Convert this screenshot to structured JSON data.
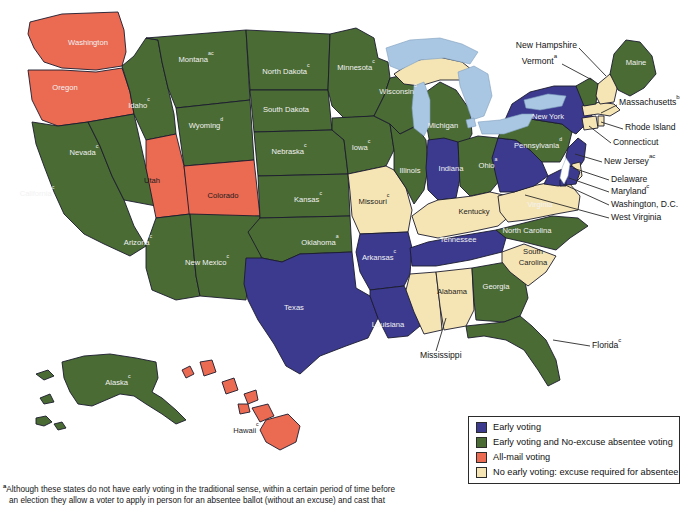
{
  "figure": {
    "type": "choropleth-map"
  },
  "colors": {
    "early_voting": "#3b3a8f",
    "early_and_no_excuse_absentee": "#4a6b34",
    "all_mail": "#ea6a52",
    "no_early_voting": "#f6e5b4",
    "lake": "#a9c6e2",
    "border": "#1b1b2e",
    "background": "#ffffff"
  },
  "legend": {
    "items": [
      {
        "color_key": "early_voting",
        "label": "Early voting"
      },
      {
        "color_key": "early_and_no_excuse_absentee",
        "label": "Early voting and No-excuse absentee voting"
      },
      {
        "color_key": "all_mail",
        "label": "All-mail voting"
      },
      {
        "color_key": "no_early_voting",
        "label": "No early voting: excuse required for absentee"
      }
    ]
  },
  "footnote": {
    "marker": "a",
    "line1": "Although these states do not have early voting in the traditional sense, within a certain period of time before",
    "line2": "an election they allow a voter to apply in person for an absentee ballot (without an excuse) and cast that"
  },
  "inline_labels": [
    {
      "name": "washington",
      "text": "Washington",
      "sup": "",
      "x": 88,
      "y": 43,
      "dark": true
    },
    {
      "name": "oregon",
      "text": "Oregon",
      "sup": "",
      "x": 65,
      "y": 88,
      "dark": true
    },
    {
      "name": "idaho",
      "text": "Idaho",
      "sup": "c",
      "x": 139,
      "y": 106,
      "dark": true
    },
    {
      "name": "montana",
      "text": "Montana",
      "sup": "ac",
      "x": 196,
      "y": 60,
      "dark": true
    },
    {
      "name": "wyoming",
      "text": "Wyoming",
      "sup": "d",
      "x": 206,
      "y": 126,
      "dark": true
    },
    {
      "name": "nevada",
      "text": "Nevada",
      "sup": "c",
      "x": 84,
      "y": 153,
      "dark": true
    },
    {
      "name": "utah",
      "text": "Utah",
      "sup": "",
      "x": 152,
      "y": 181,
      "dark": false
    },
    {
      "name": "colorado",
      "text": "Colorado",
      "sup": "",
      "x": 223,
      "y": 196,
      "dark": false
    },
    {
      "name": "california",
      "text": "California",
      "sup": "c",
      "x": 37,
      "y": 194,
      "dark": true
    },
    {
      "name": "arizona",
      "text": "Arizona",
      "sup": "c",
      "x": 138,
      "y": 243,
      "dark": true
    },
    {
      "name": "new-mexico",
      "text": "New Mexico",
      "sup": "c",
      "x": 207,
      "y": 263,
      "dark": true
    },
    {
      "name": "north-dakota",
      "text": "North Dakota",
      "sup": "c",
      "x": 286,
      "y": 72,
      "dark": true
    },
    {
      "name": "south-dakota",
      "text": "South Dakota",
      "sup": "",
      "x": 286,
      "y": 110,
      "dark": true
    },
    {
      "name": "nebraska",
      "text": "Nebraska",
      "sup": "c",
      "x": 289,
      "y": 152,
      "dark": true
    },
    {
      "name": "kansas",
      "text": "Kansas",
      "sup": "c",
      "x": 308,
      "y": 200,
      "dark": true
    },
    {
      "name": "oklahoma",
      "text": "Oklahoma",
      "sup": "a",
      "x": 320,
      "y": 243,
      "dark": true
    },
    {
      "name": "texas",
      "text": "Texas",
      "sup": "",
      "x": 294,
      "y": 308,
      "dark": true
    },
    {
      "name": "minnesota",
      "text": "Minnesota",
      "sup": "c",
      "x": 356,
      "y": 68,
      "dark": true
    },
    {
      "name": "iowa",
      "text": "Iowa",
      "sup": "c",
      "x": 361,
      "y": 148,
      "dark": true
    },
    {
      "name": "missouri",
      "text": "Missouri",
      "sup": "c",
      "x": 374,
      "y": 202,
      "dark": false
    },
    {
      "name": "arkansas",
      "text": "Arkansas",
      "sup": "c",
      "x": 379,
      "y": 258,
      "dark": true
    },
    {
      "name": "louisiana",
      "text": "Louisiana",
      "sup": "",
      "x": 388,
      "y": 325,
      "dark": true
    },
    {
      "name": "wisconsin",
      "text": "Wisconsin",
      "sup": "d",
      "x": 398,
      "y": 92,
      "dark": true
    },
    {
      "name": "illinois",
      "text": "Illinois",
      "sup": "",
      "x": 410,
      "y": 171,
      "dark": true
    },
    {
      "name": "michigan",
      "text": "Michigan",
      "sup": "",
      "x": 443,
      "y": 126,
      "dark": true
    },
    {
      "name": "indiana",
      "text": "Indiana",
      "sup": "",
      "x": 451,
      "y": 169,
      "dark": true
    },
    {
      "name": "ohio",
      "text": "Ohio",
      "sup": "a",
      "x": 488,
      "y": 166,
      "dark": true
    },
    {
      "name": "kentucky",
      "text": "Kentucky",
      "sup": "",
      "x": 474,
      "y": 212,
      "dark": false
    },
    {
      "name": "tennessee",
      "text": "Tennessee",
      "sup": "",
      "x": 458,
      "y": 240,
      "dark": true
    },
    {
      "name": "alabama",
      "text": "Alabama",
      "sup": "",
      "x": 452,
      "y": 292,
      "dark": false
    },
    {
      "name": "georgia",
      "text": "Georgia",
      "sup": "",
      "x": 496,
      "y": 287,
      "dark": true
    },
    {
      "name": "south-carolina",
      "text": "South",
      "sup": "",
      "x": 533,
      "y": 252,
      "dark": false
    },
    {
      "name": "south-carolina-2",
      "text": "Carolina",
      "sup": "",
      "x": 533,
      "y": 263,
      "dark": false
    },
    {
      "name": "north-carolina",
      "text": "North Carolina",
      "sup": "",
      "x": 527,
      "y": 231,
      "dark": true
    },
    {
      "name": "virginia",
      "text": "Virginia",
      "sup": "",
      "x": 540,
      "y": 205,
      "dark": true
    },
    {
      "name": "pennsylvania",
      "text": "Pennsylvania",
      "sup": "d",
      "x": 538,
      "y": 146,
      "dark": true
    },
    {
      "name": "new-york",
      "text": "New York",
      "sup": "",
      "x": 548,
      "y": 117,
      "dark": true
    },
    {
      "name": "maine",
      "text": "Maine",
      "sup": "",
      "x": 636,
      "y": 63,
      "dark": true
    },
    {
      "name": "alaska",
      "text": "Alaska",
      "sup": "c",
      "x": 118,
      "y": 383,
      "dark": true
    },
    {
      "name": "hawaii",
      "text": "Hawaii",
      "sup": "c",
      "x": 246,
      "y": 431,
      "dark": false
    }
  ],
  "callouts": [
    {
      "name": "new-hampshire",
      "text": "New Hampshire",
      "sup": "",
      "tx": 577,
      "ty": 46,
      "align": "end",
      "lx1": 579,
      "ly1": 48,
      "lx2": 606,
      "ly2": 76
    },
    {
      "name": "vermont",
      "text": "Vermont",
      "sup": "a",
      "tx": 557,
      "ty": 62,
      "align": "end",
      "lx1": 562,
      "ly1": 64,
      "lx2": 592,
      "ly2": 80
    },
    {
      "name": "massachusetts",
      "text": "Massachusetts",
      "sup": "b",
      "tx": 619,
      "ty": 103,
      "align": "start",
      "lx1": 617,
      "ly1": 105,
      "lx2": 601,
      "ly2": 113
    },
    {
      "name": "rhode-island",
      "text": "Rhode Island",
      "sup": "",
      "tx": 625,
      "ty": 128,
      "align": "start",
      "lx1": 623,
      "ly1": 129,
      "lx2": 601,
      "ly2": 122
    },
    {
      "name": "connecticut",
      "text": "Connecticut",
      "sup": "",
      "tx": 613,
      "ty": 143,
      "align": "start",
      "lx1": 611,
      "ly1": 143,
      "lx2": 589,
      "ly2": 126
    },
    {
      "name": "new-jersey",
      "text": "New Jersey",
      "sup": "ac",
      "tx": 604,
      "ty": 162,
      "align": "start",
      "lx1": 602,
      "ly1": 162,
      "lx2": 575,
      "ly2": 154
    },
    {
      "name": "delaware",
      "text": "Delaware",
      "sup": "",
      "tx": 611,
      "ty": 180,
      "align": "start",
      "lx1": 609,
      "ly1": 180,
      "lx2": 573,
      "ly2": 168
    },
    {
      "name": "maryland",
      "text": "Maryland",
      "sup": "c",
      "tx": 611,
      "ty": 192,
      "align": "start",
      "lx1": 609,
      "ly1": 192,
      "lx2": 569,
      "ly2": 178
    },
    {
      "name": "washington-dc",
      "text": "Washington, D.C.",
      "sup": "",
      "tx": 611,
      "ty": 205,
      "align": "start",
      "lx1": 609,
      "ly1": 205,
      "lx2": 563,
      "ly2": 184
    },
    {
      "name": "west-virginia",
      "text": "West Virginia",
      "sup": "",
      "tx": 611,
      "ty": 218,
      "align": "start",
      "lx1": 609,
      "ly1": 218,
      "lx2": 525,
      "ly2": 195
    },
    {
      "name": "florida",
      "text": "Florida",
      "sup": "c",
      "tx": 592,
      "ty": 346,
      "align": "start",
      "lx1": 590,
      "ly1": 346,
      "lx2": 553,
      "ly2": 340
    },
    {
      "name": "mississippi",
      "text": "Mississippi",
      "sup": "",
      "tx": 420,
      "ty": 356,
      "align": "start",
      "lx1": 436,
      "ly1": 351,
      "lx2": 446,
      "ly2": 318
    }
  ],
  "state_categories": {
    "early_voting": [
      "New York",
      "Indiana",
      "West Virginia",
      "Tennessee",
      "Arkansas",
      "Louisiana",
      "Texas",
      "Maryland",
      "New Jersey"
    ],
    "early_and_no_excuse_absentee": [
      "Montana",
      "Idaho",
      "Wyoming",
      "Nevada",
      "California",
      "Arizona",
      "New Mexico",
      "North Dakota",
      "South Dakota",
      "Nebraska",
      "Kansas",
      "Oklahoma",
      "Minnesota",
      "Iowa",
      "Wisconsin",
      "Illinois",
      "Michigan",
      "Ohio",
      "Georgia",
      "North Carolina",
      "Florida",
      "Maine",
      "Vermont",
      "Pennsylvania",
      "Alaska"
    ],
    "all_mail": [
      "Washington",
      "Oregon",
      "Utah",
      "Colorado",
      "Hawaii"
    ],
    "no_early_voting": [
      "Missouri",
      "Kentucky",
      "Alabama",
      "Mississippi",
      "South Carolina",
      "Virginia",
      "New Hampshire",
      "Massachusetts",
      "Rhode Island",
      "Connecticut",
      "Delaware"
    ]
  }
}
